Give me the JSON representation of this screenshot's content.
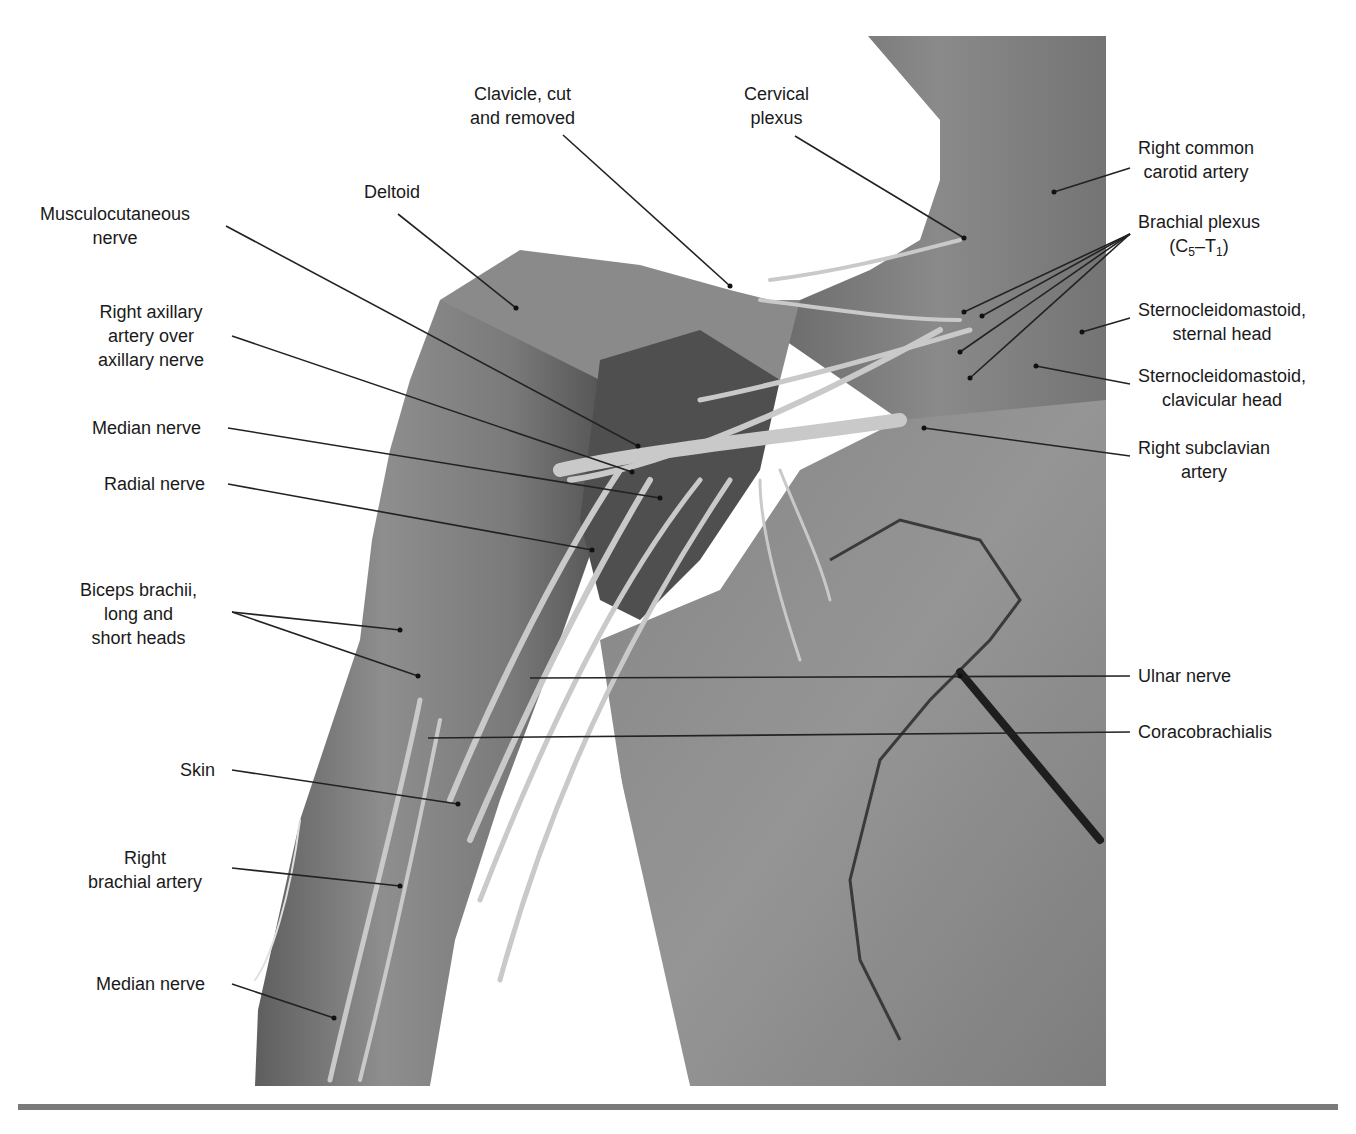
{
  "figure": {
    "photo_tone": "#8c8c8c",
    "background": "#ffffff",
    "rule_color": "#7a7a7a"
  },
  "labels_left": [
    {
      "id": "musculocutaneous",
      "lines": [
        "Musculocutaneous",
        "nerve"
      ]
    },
    {
      "id": "deltoid",
      "lines": [
        "Deltoid"
      ]
    },
    {
      "id": "right-axillary",
      "lines": [
        "Right axillary",
        "artery over",
        "axillary nerve"
      ]
    },
    {
      "id": "median-upper",
      "lines": [
        "Median nerve"
      ]
    },
    {
      "id": "radial",
      "lines": [
        "Radial nerve"
      ]
    },
    {
      "id": "biceps",
      "lines": [
        "Biceps brachii,",
        "long and",
        "short heads"
      ]
    },
    {
      "id": "skin",
      "lines": [
        "Skin"
      ]
    },
    {
      "id": "brachial-artery",
      "lines": [
        "Right",
        "brachial artery"
      ]
    },
    {
      "id": "median-lower",
      "lines": [
        "Median nerve"
      ]
    }
  ],
  "labels_top": [
    {
      "id": "clavicle",
      "lines": [
        "Clavicle, cut",
        "and removed"
      ]
    },
    {
      "id": "cervical-plexus",
      "lines": [
        "Cervical",
        "plexus"
      ]
    }
  ],
  "labels_right": [
    {
      "id": "common-carotid",
      "lines": [
        "Right common",
        "carotid artery"
      ]
    },
    {
      "id": "brachial-plexus",
      "lines": [
        "Brachial plexus"
      ],
      "sub_line": {
        "open": "(C",
        "sub1": "5",
        "dash": "–T",
        "sub2": "1",
        "close": ")"
      }
    },
    {
      "id": "scm-sternal",
      "lines": [
        "Sternocleidomastoid,",
        "sternal head"
      ]
    },
    {
      "id": "scm-clavicular",
      "lines": [
        "Sternocleidomastoid,",
        "clavicular head"
      ]
    },
    {
      "id": "subclavian",
      "lines": [
        "Right subclavian",
        "artery"
      ]
    },
    {
      "id": "ulnar",
      "lines": [
        "Ulnar nerve"
      ]
    },
    {
      "id": "coracobrachialis",
      "lines": [
        "Coracobrachialis"
      ]
    }
  ]
}
